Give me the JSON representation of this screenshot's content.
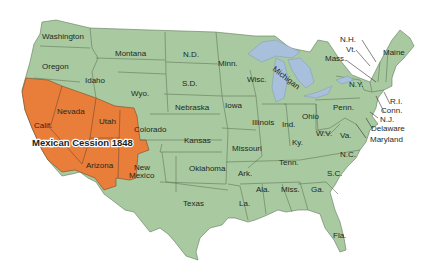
{
  "map": {
    "title": "Mexican Cession 1848",
    "colors": {
      "states": "#a9c9a0",
      "cession": "#e97d3a",
      "lakes": "#a9c0dc",
      "borders": "#5f7a5a",
      "background": "#ffffff"
    },
    "cession_states": [
      "Calif.",
      "Nevada",
      "Utah",
      "Arizona",
      "Colorado (part)",
      "Wyo. (part)",
      "New Mexico (part)"
    ],
    "labels": {
      "washington": "Washington",
      "oregon": "Oregon",
      "idaho": "Idaho",
      "montana": "Montana",
      "wyo": "Wyo.",
      "nd": "N.D.",
      "sd": "S.D.",
      "nebraska": "Nebraska",
      "minn": "Minn.",
      "wisc": "Wisc.",
      "michigan": "Michigan",
      "iowa": "Iowa",
      "illinois": "Illinois",
      "ind": "Ind.",
      "ohio": "Ohio",
      "penn": "Penn.",
      "ny": "N.Y.",
      "nh": "N.H.",
      "vt": "Vt.",
      "mass": "Mass.",
      "maine": "Maine",
      "ri": "R.I.",
      "conn": "Conn.",
      "nj": "N.J.",
      "delaware": "Delaware",
      "maryland": "Maryland",
      "wv": "W.V.",
      "va": "Va.",
      "ky": "Ky.",
      "nc": "N.C.",
      "sc": "S.C.",
      "tenn": "Tenn.",
      "ga": "Ga.",
      "ala": "Ala.",
      "miss": "Miss.",
      "fla": "Fla.",
      "la": "La.",
      "ark": "Ark.",
      "missouri": "Missouri",
      "kansas": "Kansas",
      "oklahoma": "Oklahoma",
      "texas": "Texas",
      "colorado": "Colorado",
      "utah": "Utah",
      "nevada": "Nevada",
      "calif": "Calif.",
      "arizona": "Arizona",
      "new": "New",
      "mexico": "Mexico"
    }
  }
}
